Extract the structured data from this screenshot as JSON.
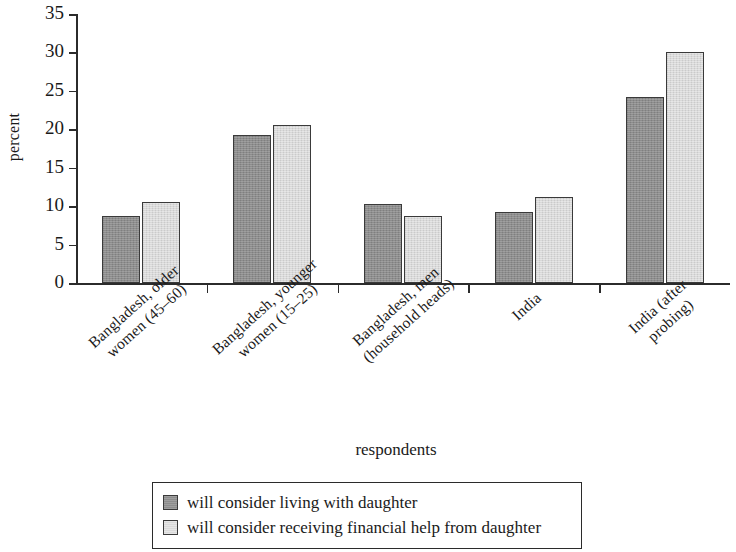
{
  "chart_data": {
    "type": "bar",
    "title": "",
    "xlabel": "respondents",
    "ylabel": "percent",
    "ylim": [
      0,
      35
    ],
    "ytick_values": [
      0,
      5,
      10,
      15,
      20,
      25,
      30,
      35
    ],
    "ytick_labels": [
      "0",
      "5",
      "10",
      "15",
      "20",
      "25",
      "30",
      "35"
    ],
    "grid": false,
    "legend_position": "bottom",
    "categories": [
      "Bangladesh, older\nwomen (45–60)",
      "Bangladesh, younger\nwomen (15–25)",
      "Bangladesh, men\n(household heads)",
      "India",
      "India (after probing)"
    ],
    "series": [
      {
        "name": "will consider living with daughter",
        "color": "#8d8d8d",
        "values": [
          8.7,
          19.3,
          10.3,
          9.2,
          24.2
        ]
      },
      {
        "name": "will consider receiving financial help from daughter",
        "color": "#d9d9d9",
        "values": [
          10.6,
          20.5,
          8.7,
          11.2,
          30.0
        ]
      }
    ]
  },
  "legend": {
    "items": [
      {
        "label": "will consider living with daughter",
        "swatch": "dark"
      },
      {
        "label": "will consider receiving financial help from daughter",
        "swatch": "light"
      }
    ]
  }
}
